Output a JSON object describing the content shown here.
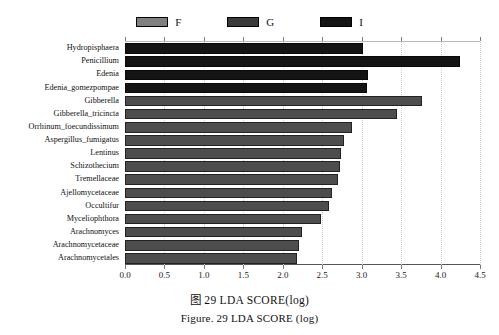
{
  "figure": {
    "caption_cn": "图 29  LDA SCORE(log)",
    "caption_en": "Figure. 29 LDA SCORE (log)"
  },
  "legend": {
    "position": "top-center",
    "items": [
      {
        "label": "F",
        "color": "#808080"
      },
      {
        "label": "G",
        "color": "#3a3a3a"
      },
      {
        "label": "I",
        "color": "#141414"
      }
    ]
  },
  "axis": {
    "x_ticks": [
      "0.0",
      "0.5",
      "1.0",
      "1.5",
      "2.0",
      "2.5",
      "3.0",
      "3.5",
      "4.0",
      "4.5"
    ],
    "x_min": 0.0,
    "x_max": 4.5
  },
  "chart_data": {
    "type": "bar",
    "orientation": "horizontal",
    "title": "LDA SCORE(log)",
    "xlabel": "LDA SCORE (log)",
    "ylabel": "",
    "xlim": [
      0.0,
      4.5
    ],
    "grid": true,
    "legend_position": "top-center",
    "categories": [
      "Hydropisphaera",
      "Penicillium",
      "Edenia",
      "Edenia_gomezpompae",
      "Gibberella",
      "Gibberella_tricincta",
      "Orrhinum_foecundissimum",
      "Aspergillus_fumigatus",
      "Lentinus",
      "Schizothecium",
      "Tremellaceae",
      "Ajellomycetaceae",
      "Occultifur",
      "Myceliophthora",
      "Arachnomyces",
      "Arachnomycetaceae",
      "Arachnomycetales"
    ],
    "values": [
      3.02,
      4.25,
      3.08,
      3.07,
      3.76,
      3.45,
      2.88,
      2.77,
      2.74,
      2.72,
      2.7,
      2.62,
      2.58,
      2.48,
      2.24,
      2.2,
      2.18
    ],
    "groups": [
      "I",
      "I",
      "I",
      "I",
      "F",
      "F",
      "F",
      "F",
      "F",
      "F",
      "F",
      "F",
      "F",
      "F",
      "F",
      "F",
      "F"
    ],
    "series": [
      {
        "name": "I",
        "color": "#141414",
        "points": [
          {
            "category": "Hydropisphaera",
            "value": 3.02
          },
          {
            "category": "Penicillium",
            "value": 4.25
          },
          {
            "category": "Edenia",
            "value": 3.08
          },
          {
            "category": "Edenia_gomezpompae",
            "value": 3.07
          }
        ]
      },
      {
        "name": "F",
        "color": "#4d4d4d",
        "points": [
          {
            "category": "Gibberella",
            "value": 3.76
          },
          {
            "category": "Gibberella_tricincta",
            "value": 3.45
          },
          {
            "category": "Orrhinum_foecundissimum",
            "value": 2.88
          },
          {
            "category": "Aspergillus_fumigatus",
            "value": 2.77
          },
          {
            "category": "Lentinus",
            "value": 2.74
          },
          {
            "category": "Schizothecium",
            "value": 2.72
          },
          {
            "category": "Tremellaceae",
            "value": 2.7
          },
          {
            "category": "Ajellomycetaceae",
            "value": 2.62
          },
          {
            "category": "Occultifur",
            "value": 2.58
          },
          {
            "category": "Myceliophthora",
            "value": 2.48
          },
          {
            "category": "Arachnomyces",
            "value": 2.24
          },
          {
            "category": "Arachnomycetaceae",
            "value": 2.2
          },
          {
            "category": "Arachnomycetales",
            "value": 2.18
          }
        ]
      }
    ]
  }
}
